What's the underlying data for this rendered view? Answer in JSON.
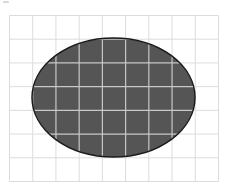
{
  "figure": {
    "grid": {
      "columns": 9,
      "rows": 7,
      "line_color": "#dcdcdc"
    },
    "ellipse": {
      "center_col": 4.4,
      "center_row": 3.5,
      "radius_cols": 3.5,
      "radius_rows": 2.5,
      "fill_color": "#555555",
      "stroke_color": "#1a1a1a",
      "inner_grid_color": "#c8c8c8"
    }
  }
}
